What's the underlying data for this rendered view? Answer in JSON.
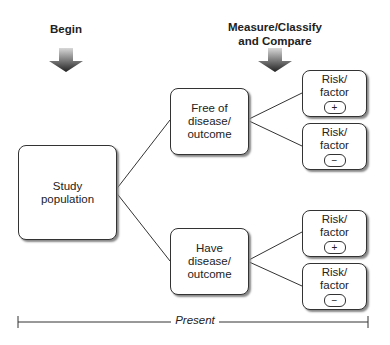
{
  "headers": {
    "begin": "Begin",
    "measure": "Measure/Classify\nand Compare"
  },
  "nodes": {
    "study": [
      "Study",
      "population"
    ],
    "free": [
      "Free of",
      "disease/",
      "outcome"
    ],
    "have": [
      "Have",
      "disease/",
      "outcome"
    ],
    "risk": [
      {
        "l1": "Risk/",
        "l2": "factor",
        "sign": "+"
      },
      {
        "l1": "Risk/",
        "l2": "factor",
        "sign": "−"
      },
      {
        "l1": "Risk/",
        "l2": "factor",
        "sign": "+"
      },
      {
        "l1": "Risk/",
        "l2": "factor",
        "sign": "−"
      }
    ]
  },
  "timeline": {
    "label": "Present"
  },
  "colors": {
    "line": "#333333",
    "arrow_top": "#cccccc",
    "arrow_bottom": "#333333"
  }
}
